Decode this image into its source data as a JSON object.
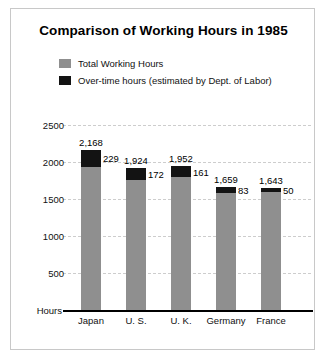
{
  "chart_data": {
    "type": "bar",
    "title": "Comparison of Working Hours in 1985",
    "xlabel": "",
    "ylabel": "Hours",
    "ylim": [
      0,
      2500
    ],
    "yticks": [
      2500,
      2000,
      1500,
      1000,
      500
    ],
    "ytick_labels": [
      "2500",
      "2000",
      "1500",
      "1000",
      "500"
    ],
    "grid": true,
    "legend_position": "top-left",
    "stacked": true,
    "categories": [
      "Japan",
      "U. S.",
      "U. K.",
      "Germany",
      "France"
    ],
    "series": [
      {
        "name": "Total Working Hours",
        "color": "#8f8f8f",
        "values": [
          2168,
          1924,
          1952,
          1659,
          1643
        ],
        "value_labels": [
          "2,168",
          "1,924",
          "1,952",
          "1,659",
          "1,643"
        ]
      },
      {
        "name": "Over-time hours (estimated by Dept. of Labor)",
        "color": "#131313",
        "values": [
          229,
          172,
          161,
          83,
          50
        ],
        "value_labels": [
          "229",
          "172",
          "161",
          "83",
          "50"
        ]
      }
    ]
  },
  "legend": {
    "items": [
      {
        "label": "Total Working Hours",
        "swatch": "total"
      },
      {
        "label": "Over-time hours (estimated by Dept. of Labor)",
        "swatch": "overtime"
      }
    ]
  }
}
